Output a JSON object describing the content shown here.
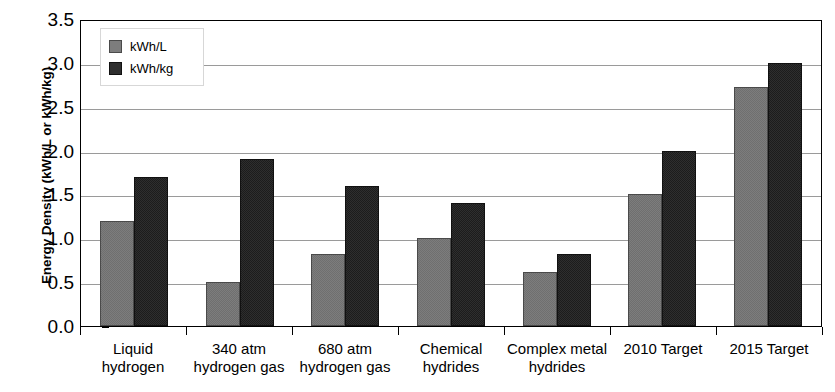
{
  "chart_data": {
    "type": "bar",
    "title": "",
    "xlabel": "",
    "ylabel": "Energy Density (kWh/L or kWh/kg)",
    "ylim": [
      0.0,
      3.5
    ],
    "ytick_labels": [
      "3.5",
      "3.0",
      "2.5",
      "2.0",
      "1.5",
      "1.0",
      "0.5",
      "0.0"
    ],
    "ytick_values": [
      3.5,
      3.0,
      2.5,
      2.0,
      1.5,
      1.0,
      0.5,
      0.0
    ],
    "grid": "horizontal",
    "legend_position": "top-left",
    "categories": [
      "Liquid\nhydrogen",
      "340 atm\nhydrogen gas",
      "680 atm\nhydrogen gas",
      "Chemical\nhydrides",
      "Complex metal\nhydrides",
      "2010 Target",
      "2015 Target"
    ],
    "series": [
      {
        "name": "kWh/L",
        "color": "#7d7d7d",
        "values": [
          1.2,
          0.5,
          0.82,
          1.0,
          0.62,
          1.5,
          2.72
        ]
      },
      {
        "name": "kWh/kg",
        "color": "#2e2e2e",
        "values": [
          1.7,
          1.9,
          1.6,
          1.4,
          0.82,
          2.0,
          3.0
        ]
      }
    ]
  }
}
